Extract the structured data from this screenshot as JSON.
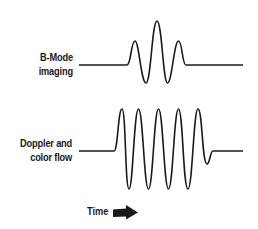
{
  "diagram": {
    "rows": [
      {
        "id": "bmode",
        "label_line1": "B-Mode",
        "label_line2": "imaging",
        "pulse_cycles": 3
      },
      {
        "id": "doppler",
        "label_line1": "Doppler and",
        "label_line2": "color flow",
        "pulse_cycles": 5
      }
    ],
    "axis": {
      "label": "Time",
      "direction_icon": "right-arrow-icon"
    },
    "colors": {
      "line": "#1a1a1a",
      "background": "#ffffff"
    }
  }
}
